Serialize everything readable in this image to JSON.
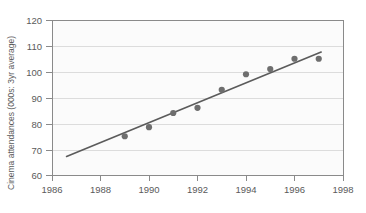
{
  "chart_data": {
    "type": "scatter",
    "title": "",
    "xlabel": "",
    "ylabel": "Cinema attendances (000s: 3yr average)",
    "xlim": [
      1986,
      1998
    ],
    "ylim": [
      60,
      120
    ],
    "xticks": [
      1986,
      1988,
      1990,
      1992,
      1994,
      1996,
      1998
    ],
    "yticks": [
      60,
      70,
      80,
      90,
      100,
      110,
      120
    ],
    "grid": "horizontal",
    "legend": "none",
    "x": [
      1989,
      1990,
      1991,
      1992,
      1993,
      1994,
      1995,
      1996,
      1997
    ],
    "values": [
      75,
      78.5,
      84,
      86,
      93,
      99,
      101,
      105,
      105
    ],
    "series": [
      {
        "name": "Cinema attendances",
        "marker": "filled-circle",
        "color": "#6e6e6e",
        "x": [
          1989,
          1990,
          1991,
          1992,
          1993,
          1994,
          1995,
          1996,
          1997
        ],
        "values": [
          75,
          78.5,
          84,
          86,
          93,
          99,
          101,
          105,
          105
        ]
      },
      {
        "name": "Trend line",
        "type": "line",
        "color": "#5b5b5b",
        "x": [
          1986.6,
          1997.1
        ],
        "values": [
          67.2,
          107.6
        ]
      }
    ],
    "annotations": []
  },
  "axes": {
    "y_title": "Cinema attendances (000s: 3yr average)",
    "y_tick_labels": [
      "120",
      "110",
      "100",
      "90",
      "80",
      "70",
      "60"
    ],
    "x_tick_labels": [
      "1986",
      "1988",
      "1990",
      "1992",
      "1994",
      "1996",
      "1998"
    ]
  }
}
